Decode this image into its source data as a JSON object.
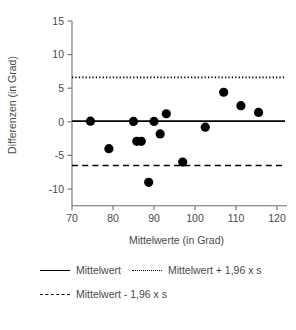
{
  "chart_data": {
    "type": "scatter",
    "title": "",
    "xlabel": "Mittelwerte (in Grad)",
    "ylabel": "Differenzen (in Grad)",
    "xlim": [
      68,
      122
    ],
    "ylim": [
      -12.5,
      15
    ],
    "xticks": [
      70,
      80,
      90,
      100,
      110,
      120
    ],
    "xtick_labels": [
      "70",
      "80",
      "90",
      "100",
      "110",
      "120"
    ],
    "yticks": [
      15,
      10,
      5,
      0,
      -5,
      -10
    ],
    "ytick_labels": [
      "15",
      "10",
      "5",
      "0",
      "-5",
      "-10"
    ],
    "grid": false,
    "legend_position": "below",
    "points": [
      {
        "x": 74.5,
        "y": 0.1
      },
      {
        "x": 79.0,
        "y": -4.0
      },
      {
        "x": 85.0,
        "y": 0.05
      },
      {
        "x": 85.8,
        "y": -2.9
      },
      {
        "x": 86.9,
        "y": -2.9
      },
      {
        "x": 88.7,
        "y": -9.0
      },
      {
        "x": 90.0,
        "y": 0.05
      },
      {
        "x": 91.5,
        "y": -1.8
      },
      {
        "x": 93.0,
        "y": 1.2
      },
      {
        "x": 97.0,
        "y": -6.0
      },
      {
        "x": 102.5,
        "y": -0.8
      },
      {
        "x": 107.0,
        "y": 4.4
      },
      {
        "x": 111.2,
        "y": 2.4
      },
      {
        "x": 115.5,
        "y": 1.4
      }
    ],
    "reference_lines": [
      {
        "name": "mean",
        "value": 0.1,
        "style": "solid",
        "label": "Mittelwert"
      },
      {
        "name": "upper-limit",
        "value": 6.6,
        "style": "dotted",
        "label": "Mittelwert + 1,96 x s"
      },
      {
        "name": "lower-limit",
        "value": -6.5,
        "style": "dashed",
        "label": "Mittelwert - 1,96 x s"
      }
    ],
    "marker": {
      "shape": "circle",
      "color": "#000000",
      "size": 4.6
    }
  },
  "legend": {
    "rows": [
      [
        {
          "style": "solid",
          "label": "Mittelwert"
        },
        {
          "style": "dotted",
          "label": "Mittelwert + 1,96 x s"
        }
      ],
      [
        {
          "style": "dashed",
          "label": "Mittelwert - 1,96 x s"
        }
      ]
    ]
  },
  "colors": {
    "line": "#000000",
    "axis": "#6f6f6f",
    "text": "#4a4a4a",
    "background": "#ffffff"
  }
}
